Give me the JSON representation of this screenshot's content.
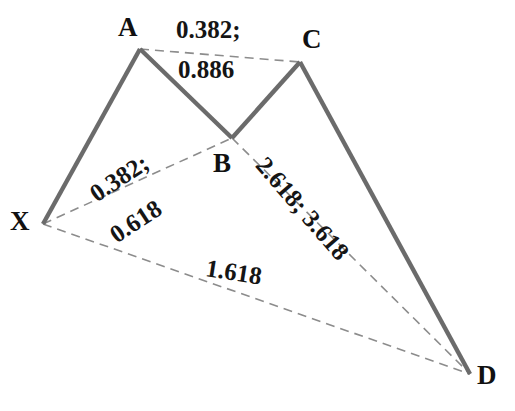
{
  "diagram": {
    "type": "harmonic-price-pattern",
    "background_color": "#ffffff",
    "solid_line_color": "#6b6b6b",
    "dashed_line_color": "#8c8c8c",
    "label_color": "#111111"
  },
  "points": [
    {
      "id": "X",
      "label": "X",
      "x": 43,
      "y": 224,
      "label_x": 10,
      "label_y": 208
    },
    {
      "id": "A",
      "label": "A",
      "x": 140,
      "y": 49,
      "label_x": 118,
      "label_y": 14
    },
    {
      "id": "B",
      "label": "B",
      "x": 232,
      "y": 138,
      "label_x": 213,
      "label_y": 150
    },
    {
      "id": "C",
      "label": "C",
      "x": 300,
      "y": 62,
      "label_x": 302,
      "label_y": 26
    },
    {
      "id": "D",
      "label": "D",
      "x": 470,
      "y": 374,
      "label_x": 477,
      "label_y": 362
    }
  ],
  "solid_segments": [
    {
      "name": "XA",
      "from": "X",
      "to": "A"
    },
    {
      "name": "AB",
      "from": "A",
      "to": "B"
    },
    {
      "name": "BC",
      "from": "B",
      "to": "C"
    },
    {
      "name": "CD",
      "from": "C",
      "to": "D"
    }
  ],
  "dashed_segments": [
    {
      "name": "AC",
      "from": "A",
      "to": "C"
    },
    {
      "name": "XB",
      "from": "X",
      "to": "B"
    },
    {
      "name": "BD",
      "from": "B",
      "to": "D"
    },
    {
      "name": "XD",
      "from": "X",
      "to": "D"
    }
  ],
  "ratio_labels": [
    {
      "id": "ac-upper",
      "segment": "AC",
      "text": "0.382;",
      "x": 176,
      "y": 17,
      "rotate": 0
    },
    {
      "id": "ac-lower",
      "segment": "AC",
      "text": "0.886",
      "x": 178,
      "y": 57,
      "rotate": 0
    },
    {
      "id": "xb-upper",
      "segment": "XB",
      "text": "0.382;",
      "x": 92,
      "y": 183,
      "rotate": -33
    },
    {
      "id": "xb-lower",
      "segment": "XB",
      "text": "0.618",
      "x": 112,
      "y": 224,
      "rotate": -33
    },
    {
      "id": "bd-ratio",
      "segment": "BD",
      "text": "2.618; 3.618",
      "x": 261,
      "y": 148,
      "rotate": 49
    },
    {
      "id": "xd-ratio",
      "segment": "XD",
      "text": "1.618",
      "x": 206,
      "y": 255,
      "rotate": 9
    }
  ]
}
